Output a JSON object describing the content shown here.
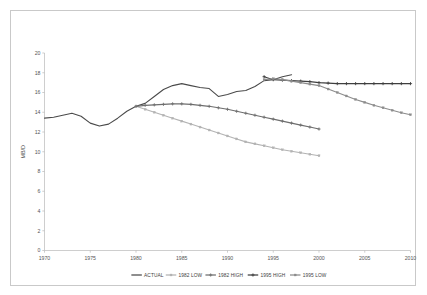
{
  "figure": {
    "background_color": "#ffffff",
    "frame_color": "#c9c9c9"
  },
  "chart_data": {
    "type": "line",
    "title": "",
    "subtitle": "",
    "xlabel": "",
    "ylabel": "MB/D",
    "xlim": [
      1970,
      2010
    ],
    "ylim": [
      0,
      20
    ],
    "x_ticks": [
      1970,
      1975,
      1980,
      1985,
      1990,
      1995,
      2000,
      2005,
      2010
    ],
    "x_tick_labels": [
      "1970",
      "1975",
      "1980",
      "1985",
      "1990",
      "1995",
      "2000",
      "2005",
      "2010"
    ],
    "y_ticks": [
      0,
      2,
      4,
      6,
      8,
      10,
      12,
      14,
      16,
      18,
      20
    ],
    "y_tick_labels": [
      "0",
      "2",
      "4",
      "6",
      "8",
      "10",
      "12",
      "14",
      "16",
      "18",
      "20"
    ],
    "grid": false,
    "legend_position": "bottom",
    "series": [
      {
        "name": "ACTUAL",
        "color": "#4a4a4a",
        "marker": "none",
        "line_width": 1.1,
        "x": [
          1970,
          1971,
          1972,
          1973,
          1974,
          1975,
          1976,
          1977,
          1978,
          1979,
          1980,
          1981,
          1982,
          1983,
          1984,
          1985,
          1986,
          1987,
          1988,
          1989,
          1990,
          1991,
          1992,
          1993,
          1994,
          1995,
          1996,
          1997
        ],
        "values": [
          13.4,
          13.5,
          13.7,
          13.9,
          13.6,
          12.9,
          12.6,
          12.8,
          13.4,
          14.1,
          14.6,
          14.9,
          15.6,
          16.3,
          16.7,
          16.9,
          16.7,
          16.5,
          16.4,
          15.6,
          15.8,
          16.1,
          16.2,
          16.6,
          17.2,
          17.3,
          17.6,
          17.8
        ]
      },
      {
        "name": "1982 LOW",
        "color": "#b3b3b3",
        "marker": "square",
        "line_width": 1.1,
        "x": [
          1980,
          1981,
          1982,
          1983,
          1984,
          1985,
          1986,
          1987,
          1988,
          1989,
          1990,
          1991,
          1992,
          1993,
          1994,
          1995,
          1996,
          1997,
          1998,
          1999,
          2000
        ],
        "values": [
          14.6,
          14.3,
          14.0,
          13.7,
          13.4,
          13.1,
          12.8,
          12.5,
          12.2,
          11.9,
          11.6,
          11.3,
          11.0,
          10.8,
          10.6,
          10.4,
          10.2,
          10.05,
          9.9,
          9.75,
          9.6
        ]
      },
      {
        "name": "1982 HIGH",
        "color": "#6e6e6e",
        "marker": "plus",
        "line_width": 1.1,
        "x": [
          1980,
          1981,
          1982,
          1983,
          1984,
          1985,
          1986,
          1987,
          1988,
          1989,
          1990,
          1991,
          1992,
          1993,
          1994,
          1995,
          1996,
          1997,
          1998,
          1999,
          2000
        ],
        "values": [
          14.6,
          14.7,
          14.75,
          14.8,
          14.85,
          14.85,
          14.8,
          14.7,
          14.6,
          14.45,
          14.3,
          14.1,
          13.9,
          13.7,
          13.5,
          13.3,
          13.1,
          12.9,
          12.7,
          12.5,
          12.3
        ]
      },
      {
        "name": "1995 HIGH",
        "color": "#3f3f3f",
        "marker": "plus",
        "line_width": 1.1,
        "x": [
          1994,
          1995,
          1996,
          1997,
          1998,
          1999,
          2000,
          2001,
          2002,
          2003,
          2004,
          2005,
          2006,
          2007,
          2008,
          2009,
          2010
        ],
        "values": [
          17.6,
          17.3,
          17.25,
          17.2,
          17.15,
          17.1,
          17.0,
          16.95,
          16.9,
          16.9,
          16.9,
          16.9,
          16.9,
          16.9,
          16.9,
          16.9,
          16.9
        ]
      },
      {
        "name": "1995 LOW",
        "color": "#8c8c8c",
        "marker": "square",
        "line_width": 1.1,
        "x": [
          1994,
          1995,
          1996,
          1997,
          1998,
          1999,
          2000,
          2001,
          2002,
          2003,
          2004,
          2005,
          2006,
          2007,
          2008,
          2009,
          2010
        ],
        "values": [
          17.3,
          17.4,
          17.3,
          17.15,
          17.0,
          16.85,
          16.7,
          16.35,
          16.0,
          15.65,
          15.3,
          15.0,
          14.7,
          14.45,
          14.2,
          13.95,
          13.75
        ]
      }
    ]
  },
  "legend": {
    "items": [
      {
        "label": "ACTUAL"
      },
      {
        "label": "1982 LOW"
      },
      {
        "label": "1982 HIGH"
      },
      {
        "label": "1995 HIGH"
      },
      {
        "label": "1995 LOW"
      }
    ]
  }
}
